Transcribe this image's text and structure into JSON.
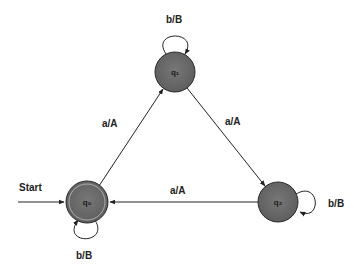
{
  "diagram": {
    "type": "finite-state-transducer",
    "colors": {
      "state_fill": "#6b6b6b",
      "state_stroke": "#2a2a2a",
      "edge_stroke": "#222222",
      "background": "#ffffff"
    },
    "start": {
      "label": "Start",
      "target": "q0"
    },
    "states": [
      {
        "id": "q0",
        "label": "q₀",
        "accepting": true,
        "initial": true
      },
      {
        "id": "q1",
        "label": "q₁",
        "accepting": false,
        "initial": false
      },
      {
        "id": "q2",
        "label": "q₂",
        "accepting": false,
        "initial": false
      }
    ],
    "transitions": [
      {
        "from": "q0",
        "to": "q1",
        "label": "a/A"
      },
      {
        "from": "q1",
        "to": "q2",
        "label": "a/A"
      },
      {
        "from": "q2",
        "to": "q0",
        "label": "a/A"
      },
      {
        "from": "q0",
        "to": "q0",
        "label": "b/B"
      },
      {
        "from": "q1",
        "to": "q1",
        "label": "b/B"
      },
      {
        "from": "q2",
        "to": "q2",
        "label": "b/B"
      }
    ]
  }
}
